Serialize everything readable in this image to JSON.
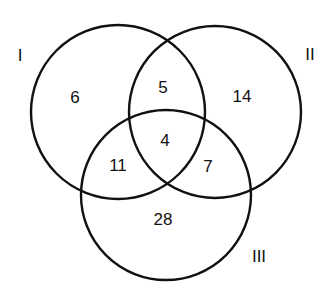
{
  "diagram": {
    "type": "venn-3",
    "sets": [
      {
        "id": "I",
        "label": "I"
      },
      {
        "id": "II",
        "label": "II"
      },
      {
        "id": "III",
        "label": "III"
      }
    ],
    "regions": {
      "I_only": "6",
      "II_only": "14",
      "III_only": "28",
      "I_II": "5",
      "I_III": "11",
      "II_III": "7",
      "I_II_III": "4"
    },
    "stroke_color": "#111111",
    "background": "#ffffff"
  }
}
